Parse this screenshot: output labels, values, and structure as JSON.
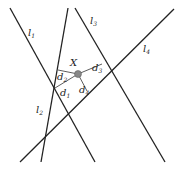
{
  "diagram": {
    "lines": [
      {
        "id": "l1",
        "label": "l",
        "sub": "1",
        "x1": 10,
        "y1": 8,
        "x2": 95,
        "y2": 162,
        "lx": 28,
        "ly": 36
      },
      {
        "id": "l2",
        "label": "l",
        "sub": "2",
        "x1": 68,
        "y1": 8,
        "x2": 41,
        "y2": 162,
        "lx": 36,
        "ly": 113
      },
      {
        "id": "l3",
        "label": "l",
        "sub": "3",
        "x1": 75,
        "y1": 8,
        "x2": 165,
        "y2": 162,
        "lx": 90,
        "ly": 24
      },
      {
        "id": "l4",
        "label": "l",
        "sub": "4",
        "x1": 174,
        "y1": 9,
        "x2": 20,
        "y2": 162,
        "lx": 143,
        "ly": 52
      }
    ],
    "point": {
      "label": "X",
      "x": 78,
      "y": 74,
      "lx": 70,
      "ly": 66,
      "color": "#888888"
    },
    "distances": [
      {
        "label": "d",
        "sub": "1",
        "x2": 55,
        "y2": 88,
        "lx": 60,
        "ly": 96
      },
      {
        "label": "d",
        "sub": "2",
        "x2": 58,
        "y2": 70,
        "lx": 57,
        "ly": 80
      },
      {
        "label": "d",
        "sub": "3",
        "x2": 102,
        "y2": 64,
        "lx": 92,
        "ly": 71
      },
      {
        "label": "d",
        "sub": "4",
        "x2": 87,
        "y2": 91,
        "lx": 79,
        "ly": 93
      }
    ]
  }
}
